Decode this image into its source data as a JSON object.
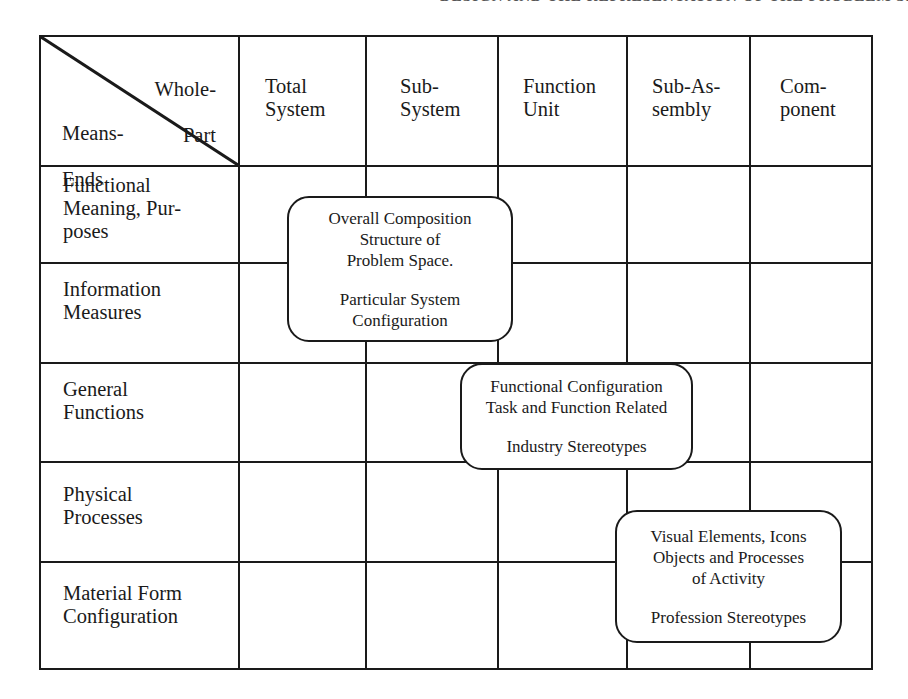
{
  "page_header": "DESIGN AND THE REPRESENTATION OF THE PROBLEM SPACE",
  "corner": {
    "top_right_label": [
      "Whole-",
      "Part"
    ],
    "bottom_left_label": [
      "Means-",
      "Ends"
    ]
  },
  "columns": [
    {
      "label": "Total\nSystem"
    },
    {
      "label": "Sub-\nSystem"
    },
    {
      "label": "Function\nUnit"
    },
    {
      "label": "Sub-As-\nsembly"
    },
    {
      "label": "Com-\nponent"
    }
  ],
  "rows": [
    {
      "label": "Functional\nMeaning, Pur-\nposes"
    },
    {
      "label": "Information\nMeasures"
    },
    {
      "label": "General\nFunctions"
    },
    {
      "label": "Physical\nProcesses"
    },
    {
      "label": "Material Form\nConfiguration"
    }
  ],
  "boxes": [
    {
      "name": "overall-composition",
      "lines_top": [
        "Overall Composition",
        "Structure of",
        "Problem Space."
      ],
      "lines_bottom": [
        "Particular System",
        "Configuration"
      ]
    },
    {
      "name": "functional-configuration",
      "lines_top": [
        "Functional Configuration",
        "Task and Function Related"
      ],
      "lines_bottom": [
        "Industry Stereotypes"
      ]
    },
    {
      "name": "visual-elements",
      "lines_top": [
        "Visual Elements, Icons",
        "Objects and Processes",
        "of Activity"
      ],
      "lines_bottom": [
        "Profession Stereotypes"
      ]
    }
  ],
  "colors": {
    "line": "#1a1a1a",
    "background": "#ffffff"
  }
}
